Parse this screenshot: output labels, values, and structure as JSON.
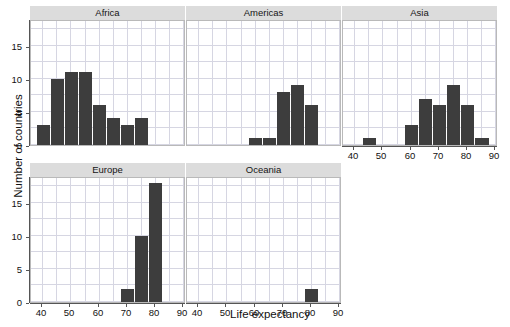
{
  "chart_data": {
    "type": "bar",
    "chart_style": "faceted histogram (small multiples)",
    "title": "",
    "xlabel": "Life expectancy",
    "ylabel": "Number of countries",
    "xlim": [
      36,
      91
    ],
    "ylim": [
      0,
      19
    ],
    "xticks": [
      40,
      50,
      60,
      70,
      80,
      90
    ],
    "yticks": [
      0,
      5,
      10,
      15
    ],
    "grid": true,
    "legend": null,
    "bin_width": 5,
    "bar_color": "#3d3d3d",
    "strip_color": "#dcdcdc",
    "grid_color": "#d6d6e2",
    "panels": [
      {
        "label": "Africa",
        "row": 0,
        "col": 0,
        "show_xaxis": false,
        "bins": [
          {
            "x0": 38,
            "x1": 43,
            "count": 3
          },
          {
            "x0": 43,
            "x1": 48,
            "count": 10
          },
          {
            "x0": 48,
            "x1": 53,
            "count": 11
          },
          {
            "x0": 53,
            "x1": 58,
            "count": 11
          },
          {
            "x0": 58,
            "x1": 63,
            "count": 6
          },
          {
            "x0": 63,
            "x1": 68,
            "count": 4
          },
          {
            "x0": 68,
            "x1": 73,
            "count": 3
          },
          {
            "x0": 73,
            "x1": 78,
            "count": 4
          }
        ]
      },
      {
        "label": "Americas",
        "row": 0,
        "col": 1,
        "show_xaxis": false,
        "bins": [
          {
            "x0": 58,
            "x1": 63,
            "count": 1
          },
          {
            "x0": 63,
            "x1": 68,
            "count": 1
          },
          {
            "x0": 68,
            "x1": 73,
            "count": 8
          },
          {
            "x0": 73,
            "x1": 78,
            "count": 9
          },
          {
            "x0": 78,
            "x1": 83,
            "count": 6
          }
        ]
      },
      {
        "label": "Asia",
        "row": 0,
        "col": 2,
        "show_xaxis": true,
        "bins": [
          {
            "x0": 43,
            "x1": 48,
            "count": 1
          },
          {
            "x0": 58,
            "x1": 63,
            "count": 3
          },
          {
            "x0": 63,
            "x1": 68,
            "count": 7
          },
          {
            "x0": 68,
            "x1": 73,
            "count": 6
          },
          {
            "x0": 73,
            "x1": 78,
            "count": 9
          },
          {
            "x0": 78,
            "x1": 83,
            "count": 6
          },
          {
            "x0": 83,
            "x1": 88,
            "count": 1
          }
        ]
      },
      {
        "label": "Europe",
        "row": 1,
        "col": 0,
        "show_xaxis": true,
        "bins": [
          {
            "x0": 68,
            "x1": 73,
            "count": 2
          },
          {
            "x0": 73,
            "x1": 78,
            "count": 10
          },
          {
            "x0": 78,
            "x1": 83,
            "count": 18
          }
        ]
      },
      {
        "label": "Oceania",
        "row": 1,
        "col": 1,
        "show_xaxis": true,
        "bins": [
          {
            "x0": 78,
            "x1": 83,
            "count": 2
          }
        ]
      }
    ]
  }
}
